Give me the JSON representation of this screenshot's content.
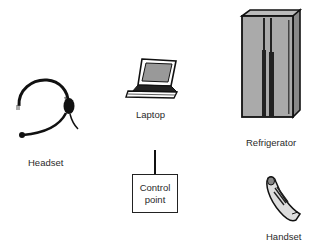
{
  "diagram": {
    "title": "",
    "nodes": [
      {
        "id": "headset",
        "label": "Headset",
        "icon": "headset-icon"
      },
      {
        "id": "laptop",
        "label": "Laptop",
        "icon": "laptop-icon"
      },
      {
        "id": "refrigerator",
        "label": "Refrigerator",
        "icon": "refrigerator-icon"
      },
      {
        "id": "control_point",
        "label_line1": "Control",
        "label_line2": "point",
        "shape": "box"
      },
      {
        "id": "handset",
        "label": "Handset",
        "icon": "handset-icon"
      }
    ],
    "connections": [
      {
        "from": "control_point",
        "to": "network",
        "style": "vertical-line"
      }
    ]
  }
}
